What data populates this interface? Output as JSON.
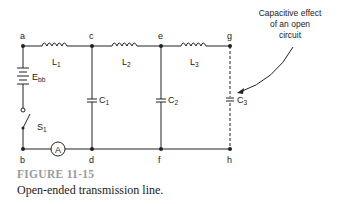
{
  "figure": {
    "number": "FIGURE 11-15",
    "caption": "Open-ended transmission line."
  },
  "nodes": {
    "top": [
      "a",
      "c",
      "e",
      "g"
    ],
    "bottom": [
      "b",
      "d",
      "f",
      "h"
    ]
  },
  "components": {
    "inductors": [
      {
        "label": "L",
        "sub": "1"
      },
      {
        "label": "L",
        "sub": "2"
      },
      {
        "label": "L",
        "sub": "3"
      }
    ],
    "capacitors": [
      {
        "label": "C",
        "sub": "1"
      },
      {
        "label": "C",
        "sub": "2"
      },
      {
        "label": "C",
        "sub": "3"
      }
    ],
    "battery": {
      "label": "E",
      "sub": "bb"
    },
    "switch": {
      "label": "S",
      "sub": "1"
    },
    "ammeter": {
      "label": "A"
    }
  },
  "annotation": {
    "lines": [
      "Capacitive effect",
      "of an open",
      "circuit"
    ]
  },
  "colors": {
    "line": "#222222",
    "figure_number": "#9a9a9a"
  }
}
